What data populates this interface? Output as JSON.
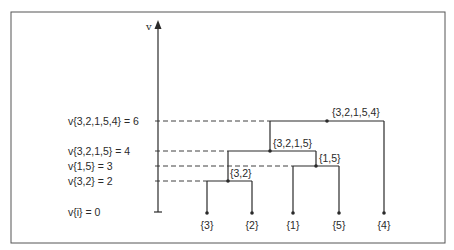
{
  "diagram": {
    "type": "dendrogram",
    "axis_label": "v",
    "levels": [
      {
        "label": "v{3,2,1,5,4} = 6",
        "value": 6
      },
      {
        "label": "v{3,2,1,5} = 4",
        "value": 4
      },
      {
        "label": "v{1,5} = 3",
        "value": 3
      },
      {
        "label": "v{3,2} = 2",
        "value": 2
      },
      {
        "label": "v{i} = 0",
        "value": 0
      }
    ],
    "leaves": [
      {
        "id": "3",
        "label": "{3}"
      },
      {
        "id": "2",
        "label": "{2}"
      },
      {
        "id": "1",
        "label": "{1}"
      },
      {
        "id": "5",
        "label": "{5}"
      },
      {
        "id": "4",
        "label": "{4}"
      }
    ],
    "merges": [
      {
        "label": "{3,2}",
        "children": [
          "{3}",
          "{2}"
        ],
        "value": 2
      },
      {
        "label": "{1,5}",
        "children": [
          "{1}",
          "{5}"
        ],
        "value": 3
      },
      {
        "label": "{3,2,1,5}",
        "children": [
          "{3,2}",
          "{1,5}"
        ],
        "value": 4
      },
      {
        "label": "{3,2,1,5,4}",
        "children": [
          "{3,2,1,5}",
          "{4}"
        ],
        "value": 6
      }
    ]
  }
}
